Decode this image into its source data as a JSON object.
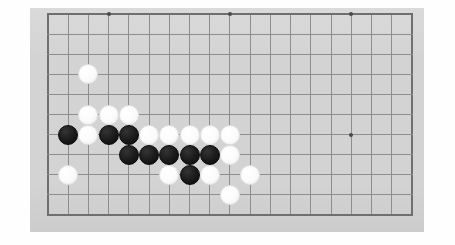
{
  "app": {
    "title": "Go Board Position",
    "board_label": "goban",
    "canvas_width": 455,
    "canvas_height": 245
  },
  "colors": {
    "page_background": "#fefefe",
    "board_background": "#d3d3d3",
    "grid_line": "#8e8e8e",
    "grid_edge": "#6f6f6f",
    "star_point": "#4a4a4a",
    "white_stone": "#fbfbfb",
    "black_stone": "#1b1b1b"
  },
  "board": {
    "panel": {
      "x": 30,
      "y": 8,
      "width": 394,
      "height": 224
    },
    "grid": {
      "origin_x": 48,
      "origin_y": 14,
      "spacing_x": 20.22,
      "spacing_y": 20.1,
      "columns": 19,
      "rows": 11,
      "show_grid": true,
      "left_edge_x": 48,
      "right_edge_x": 412,
      "top_edge_y": 14,
      "bottom_edge_y": 215
    },
    "star_points": [
      {
        "col": 3,
        "row": 0,
        "label": "hoshi-top-left"
      },
      {
        "col": 9,
        "row": 0,
        "label": "hoshi-top-center"
      },
      {
        "col": 15,
        "row": 0,
        "label": "hoshi-top-right"
      },
      {
        "col": 15,
        "row": 6,
        "label": "hoshi-right-center"
      }
    ],
    "stone_radius": 10,
    "stones": [
      {
        "col": 2,
        "row": 3,
        "color": "white",
        "label": "white-stone-c2r3"
      },
      {
        "col": 2,
        "row": 5,
        "color": "white",
        "label": "white-stone-c2r5"
      },
      {
        "col": 3,
        "row": 5,
        "color": "white",
        "label": "white-stone-c3r5"
      },
      {
        "col": 4,
        "row": 5,
        "color": "white",
        "label": "white-stone-c4r5"
      },
      {
        "col": 1,
        "row": 6,
        "color": "black",
        "label": "black-stone-c1r6"
      },
      {
        "col": 2,
        "row": 6,
        "color": "white",
        "label": "white-stone-c2r6"
      },
      {
        "col": 3,
        "row": 6,
        "color": "black",
        "label": "black-stone-c3r6"
      },
      {
        "col": 4,
        "row": 6,
        "color": "black",
        "label": "black-stone-c4r6"
      },
      {
        "col": 5,
        "row": 6,
        "color": "white",
        "label": "white-stone-c5r6"
      },
      {
        "col": 6,
        "row": 6,
        "color": "white",
        "label": "white-stone-c6r6"
      },
      {
        "col": 7,
        "row": 6,
        "color": "white",
        "label": "white-stone-c7r6"
      },
      {
        "col": 8,
        "row": 6,
        "color": "white",
        "label": "white-stone-c8r6"
      },
      {
        "col": 9,
        "row": 6,
        "color": "white",
        "label": "white-stone-c9r6"
      },
      {
        "col": 4,
        "row": 7,
        "color": "black",
        "label": "black-stone-c4r7"
      },
      {
        "col": 5,
        "row": 7,
        "color": "black",
        "label": "black-stone-c5r7"
      },
      {
        "col": 6,
        "row": 7,
        "color": "black",
        "label": "black-stone-c6r7"
      },
      {
        "col": 7,
        "row": 7,
        "color": "black",
        "label": "black-stone-c7r7"
      },
      {
        "col": 8,
        "row": 7,
        "color": "black",
        "label": "black-stone-c8r7"
      },
      {
        "col": 9,
        "row": 7,
        "color": "white",
        "label": "white-stone-c9r7"
      },
      {
        "col": 1,
        "row": 8,
        "color": "white",
        "label": "white-stone-c1r8"
      },
      {
        "col": 6,
        "row": 8,
        "color": "white",
        "label": "white-stone-c6r8"
      },
      {
        "col": 7,
        "row": 8,
        "color": "black",
        "label": "black-stone-c7r8"
      },
      {
        "col": 8,
        "row": 8,
        "color": "white",
        "label": "white-stone-c8r8"
      },
      {
        "col": 10,
        "row": 8,
        "color": "white",
        "label": "white-stone-c10r8"
      },
      {
        "col": 9,
        "row": 9,
        "color": "white",
        "label": "white-stone-c9r9"
      }
    ]
  }
}
